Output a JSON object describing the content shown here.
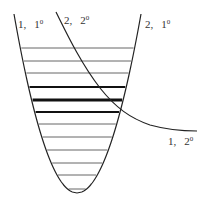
{
  "diagram": {
    "type": "energy-level potential well with crossing curve",
    "labels": {
      "left_top": {
        "state": "1,",
        "level": "1",
        "sup": "0"
      },
      "middle_top": {
        "state": "2,",
        "level": "2",
        "sup": "0"
      },
      "right_top": {
        "state": "2,",
        "level": "1",
        "sup": "0"
      },
      "right_bottom": {
        "state": "1,",
        "level": "2",
        "sup": "0"
      }
    },
    "parabola": {
      "vertex": [
        77,
        193
      ],
      "left_top": [
        14,
        14
      ],
      "right_top": [
        141,
        14
      ],
      "color": "#222222"
    },
    "crossing_curve": {
      "start": [
        56,
        12
      ],
      "end": [
        197,
        131
      ],
      "color": "#222222"
    },
    "levels": [
      {
        "y": 48,
        "weight": 1
      },
      {
        "y": 61,
        "weight": 1
      },
      {
        "y": 73,
        "weight": 1
      },
      {
        "y": 87,
        "weight": 2
      },
      {
        "y": 100,
        "weight": 3.2
      },
      {
        "y": 112,
        "weight": 2
      },
      {
        "y": 124,
        "weight": 1
      },
      {
        "y": 137,
        "weight": 1
      },
      {
        "y": 150,
        "weight": 1
      },
      {
        "y": 163,
        "weight": 1
      },
      {
        "y": 175,
        "weight": 1
      },
      {
        "y": 189,
        "weight": 1
      }
    ]
  }
}
